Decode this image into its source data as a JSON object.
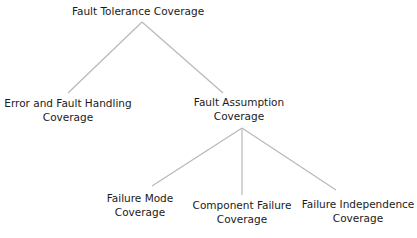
{
  "diagram": {
    "type": "tree",
    "line_color": "#b8b8b8",
    "root": {
      "id": "ftc",
      "label": [
        "Fault Tolerance Coverage"
      ]
    },
    "level1": [
      {
        "id": "efhc",
        "label": [
          "Error and Fault Handling",
          "Coverage"
        ]
      },
      {
        "id": "fac",
        "label": [
          "Fault Assumption",
          "Coverage"
        ]
      }
    ],
    "level2": [
      {
        "id": "fmc",
        "parent": "fac",
        "label": [
          "Failure Mode",
          "Coverage"
        ]
      },
      {
        "id": "cfc",
        "parent": "fac",
        "label": [
          "Component Failure",
          "Coverage"
        ]
      },
      {
        "id": "fic",
        "parent": "fac",
        "label": [
          "Failure Independence",
          "Coverage"
        ]
      }
    ]
  }
}
